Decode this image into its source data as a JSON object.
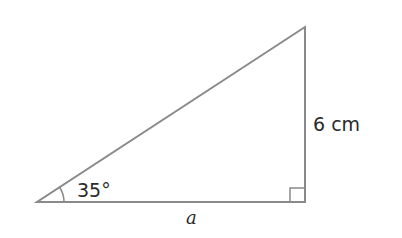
{
  "diagram": {
    "type": "right-triangle",
    "colors": {
      "background": "#ffffff",
      "stroke": "#8a8a8a",
      "text": "#2a2a2a"
    },
    "vertices": {
      "left": [
        37,
        202
      ],
      "right_angle": [
        305,
        202
      ],
      "top": [
        305,
        27
      ]
    },
    "labels": {
      "angle": "35°",
      "vertical_side": "6 cm",
      "base_side": "a"
    },
    "markers": {
      "angle_arc": "35-degree angle at left vertex",
      "right_angle": "right angle square at bottom-right vertex"
    }
  }
}
